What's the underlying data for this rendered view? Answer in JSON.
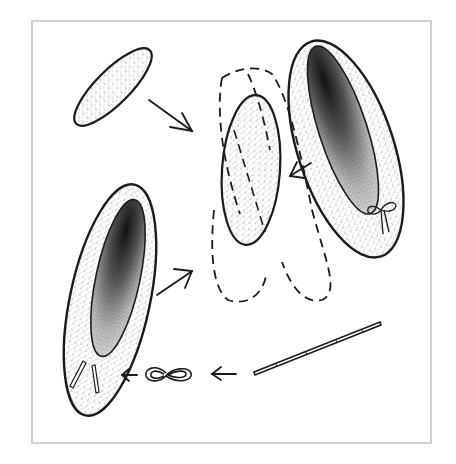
{
  "diagram": {
    "frame": {
      "border_color": "#cfcfcf",
      "background": "#ffffff"
    },
    "colors": {
      "ink": "#1a1a1a",
      "stipple": "#3a3a3a",
      "shadow": "#111111"
    },
    "elements": [
      {
        "id": "insole",
        "description": "stippled oval insole piece"
      },
      {
        "id": "arrow-insole-to-assembly",
        "description": "arrow pointing from insole toward assembly"
      },
      {
        "id": "assembly",
        "description": "stippled sole with dashed outline of upper pieces"
      },
      {
        "id": "finished-slipper-right",
        "description": "finished slipper with bow at toe"
      },
      {
        "id": "arrow-slipper-to-assembly",
        "description": "arrow pointing from finished slipper to assembly"
      },
      {
        "id": "finished-slipper-left",
        "description": "slipper with elastic ends at heel"
      },
      {
        "id": "arrow-left-slipper-to-assembly",
        "description": "arrow pointing from left slipper to assembly"
      },
      {
        "id": "elastic-strip",
        "description": "long narrow elastic strip"
      },
      {
        "id": "arrow-strip-to-loop",
        "description": "arrow pointing from strip to looped elastic"
      },
      {
        "id": "elastic-loop",
        "description": "figure-eight loop of elastic"
      },
      {
        "id": "arrow-loop-to-slipper",
        "description": "arrow pointing from loop to slipper heel"
      }
    ]
  }
}
